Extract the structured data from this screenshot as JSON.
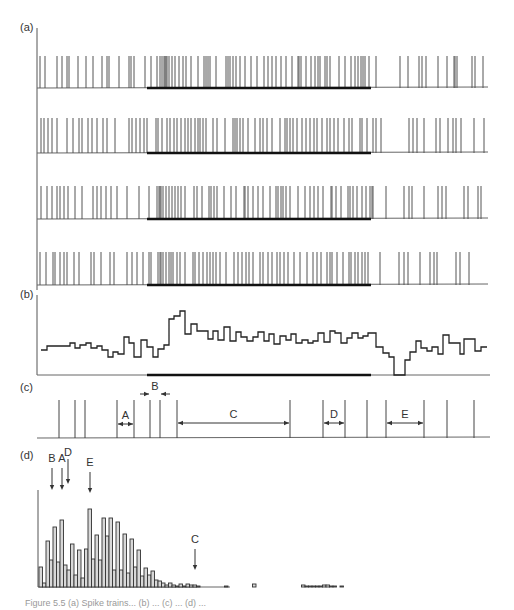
{
  "figure": {
    "panel_labels": {
      "a": "(a)",
      "b": "(b)",
      "c": "(c)",
      "d": "(d)"
    },
    "caption_partial": "Figure 5.5 (a) Spike trains... (b) ... (c) ... (d) ..."
  },
  "chart_data": [
    {
      "panel": "a",
      "type": "raster",
      "title": "",
      "description": "Four spike-train trials; thick bar marks stimulus period",
      "axis_x": 37,
      "stimulus_bar": {
        "x_start": 147,
        "x_end": 371
      },
      "rows": [
        {
          "baseline_y": 88,
          "top_y": 56,
          "spikes": [
            40,
            45,
            57,
            62,
            67,
            69,
            78,
            86,
            93,
            102,
            107,
            109,
            119,
            129,
            131,
            134,
            145,
            151,
            157,
            160,
            162,
            164,
            165,
            166,
            167,
            169,
            172,
            175,
            179,
            183,
            186,
            191,
            198,
            204,
            206,
            208,
            210,
            216,
            226,
            228,
            230,
            233,
            236,
            240,
            245,
            251,
            257,
            264,
            268,
            272,
            276,
            281,
            286,
            292,
            298,
            299,
            301,
            306,
            311,
            315,
            318,
            320,
            325,
            327,
            330,
            339,
            345,
            351,
            355,
            358,
            361,
            363,
            365,
            369,
            376,
            400,
            408,
            419,
            422,
            426,
            438,
            447,
            454,
            455,
            457,
            472,
            475,
            483
          ]
        },
        {
          "baseline_y": 153,
          "top_y": 118,
          "spikes": [
            41,
            44,
            48,
            52,
            57,
            67,
            73,
            79,
            82,
            88,
            92,
            97,
            103,
            107,
            115,
            129,
            132,
            136,
            140,
            144,
            147,
            156,
            158,
            162,
            167,
            170,
            174,
            177,
            181,
            185,
            188,
            191,
            195,
            198,
            200,
            203,
            206,
            213,
            217,
            225,
            233,
            235,
            237,
            240,
            243,
            248,
            255,
            260,
            263,
            267,
            272,
            280,
            285,
            287,
            290,
            293,
            297,
            302,
            306,
            310,
            314,
            317,
            322,
            327,
            330,
            334,
            338,
            344,
            349,
            352,
            360,
            362,
            367,
            373,
            376,
            381,
            409,
            413,
            417,
            424,
            436,
            440,
            448,
            453,
            456,
            461,
            474,
            484
          ]
        },
        {
          "baseline_y": 219,
          "top_y": 186,
          "spikes": [
            41,
            47,
            52,
            57,
            60,
            64,
            68,
            75,
            82,
            93,
            97,
            101,
            106,
            111,
            117,
            127,
            139,
            149,
            157,
            159,
            160,
            161,
            163,
            166,
            169,
            172,
            175,
            178,
            181,
            185,
            194,
            197,
            202,
            209,
            211,
            214,
            217,
            224,
            231,
            236,
            244,
            245,
            248,
            253,
            258,
            263,
            270,
            276,
            278,
            281,
            283,
            286,
            290,
            298,
            305,
            310,
            314,
            318,
            323,
            331,
            332,
            336,
            341,
            348,
            350,
            353,
            357,
            362,
            366,
            370,
            372,
            373,
            386,
            404,
            409,
            412,
            424,
            438,
            442,
            446,
            464,
            468,
            478,
            481
          ]
        },
        {
          "baseline_y": 285,
          "top_y": 252,
          "spikes": [
            40,
            46,
            53,
            55,
            60,
            64,
            67,
            74,
            79,
            91,
            94,
            101,
            110,
            114,
            127,
            132,
            137,
            143,
            149,
            151,
            158,
            160,
            161,
            163,
            166,
            169,
            171,
            173,
            177,
            180,
            185,
            193,
            195,
            199,
            203,
            207,
            210,
            213,
            216,
            220,
            226,
            234,
            238,
            242,
            246,
            249,
            253,
            260,
            263,
            268,
            272,
            277,
            280,
            284,
            288,
            294,
            300,
            307,
            313,
            317,
            321,
            327,
            330,
            332,
            337,
            343,
            349,
            351,
            355,
            358,
            362,
            365,
            368,
            380,
            399,
            404,
            408,
            420,
            430,
            434,
            437,
            456,
            460,
            469
          ]
        }
      ]
    },
    {
      "panel": "b",
      "type": "step",
      "title": "",
      "description": "Peri-stimulus time histogram (firing rate), step plot",
      "axis": {
        "x0": 37,
        "x1": 490,
        "y_baseline": 375,
        "y_top": 295
      },
      "stimulus_bar": {
        "x_start": 147,
        "x_end": 371
      },
      "x_edges": [
        41,
        47,
        64,
        70,
        75,
        80,
        86,
        91,
        97,
        102,
        108,
        113,
        118,
        124,
        129,
        134,
        141,
        147,
        153,
        158,
        164,
        169,
        174,
        180,
        185,
        191,
        197,
        202,
        208,
        213,
        218,
        224,
        230,
        236,
        241,
        247,
        253,
        258,
        264,
        269,
        274,
        280,
        286,
        291,
        296,
        302,
        308,
        313,
        318,
        324,
        330,
        335,
        341,
        347,
        352,
        358,
        363,
        368,
        376,
        383,
        389,
        394,
        400,
        405,
        410,
        416,
        421,
        427,
        432,
        438,
        443,
        449,
        454,
        460,
        464,
        469,
        475,
        481,
        487
      ],
      "y_levels": [
        350,
        346,
        346,
        343,
        348,
        345,
        343,
        348,
        346,
        350,
        357,
        352,
        354,
        337,
        343,
        357,
        340,
        347,
        357,
        349,
        345,
        319,
        316,
        311,
        334,
        324,
        331,
        331,
        339,
        331,
        340,
        327,
        341,
        332,
        337,
        341,
        337,
        332,
        341,
        334,
        344,
        336,
        340,
        334,
        343,
        340,
        343,
        341,
        333,
        342,
        331,
        333,
        343,
        338,
        333,
        338,
        336,
        333,
        347,
        353,
        357,
        375,
        375,
        360,
        352,
        341,
        348,
        351,
        347,
        354,
        335,
        343,
        343,
        354,
        339,
        339,
        351,
        347
      ]
    },
    {
      "panel": "c",
      "type": "raster",
      "title": "",
      "description": "Example spike train with labeled interspike intervals",
      "baseline_y": 438,
      "top_y": 400,
      "axis_x0": 37,
      "axis_x1": 490,
      "spikes": [
        59,
        75,
        85,
        117,
        134,
        150,
        160,
        177,
        290,
        323,
        345,
        367,
        386,
        424,
        447,
        474
      ],
      "intervals": [
        {
          "label": "A",
          "from": 117,
          "to": 134,
          "y": 424,
          "style": "inside"
        },
        {
          "label": "B",
          "from": 150,
          "to": 160,
          "y": 394,
          "style": "outside"
        },
        {
          "label": "C",
          "from": 177,
          "to": 290,
          "y": 423,
          "style": "inside"
        },
        {
          "label": "D",
          "from": 323,
          "to": 345,
          "y": 423,
          "style": "inside"
        },
        {
          "label": "E",
          "from": 386,
          "to": 424,
          "y": 423,
          "style": "inside"
        }
      ]
    },
    {
      "panel": "d",
      "type": "bar",
      "title": "",
      "description": "Interspike interval histogram; arrows mark intervals A–E from panel (c)",
      "axis": {
        "x0": 38,
        "x1": 230,
        "y_baseline": 587,
        "y_top": 490
      },
      "bin_width": 3.5,
      "x_start": 39,
      "values": [
        20,
        4,
        46,
        27,
        60,
        25,
        67,
        22,
        17,
        43,
        12,
        37,
        9,
        38,
        78,
        28,
        52,
        27,
        69,
        51,
        69,
        17,
        65,
        17,
        53,
        14,
        48,
        20,
        37,
        11,
        19,
        12,
        16,
        7,
        6,
        4,
        2,
        4,
        2,
        1,
        3,
        1,
        3,
        2,
        2,
        1,
        0,
        0,
        0,
        0,
        0,
        0,
        0,
        1,
        0,
        0,
        0,
        0,
        0,
        0,
        0,
        3,
        0,
        0,
        0,
        0,
        0,
        0,
        0,
        0,
        0,
        0,
        0,
        0,
        0,
        2,
        1,
        1,
        1,
        1,
        1,
        2,
        2,
        1,
        1,
        0,
        1
      ],
      "arrows": [
        {
          "label": "B",
          "x": 52,
          "label_y": 462,
          "y_start": 468,
          "y_end": 490
        },
        {
          "label": "A",
          "x": 62,
          "label_y": 462,
          "y_start": 468,
          "y_end": 490
        },
        {
          "label": "D",
          "x": 68,
          "label_y": 456,
          "y_start": 459,
          "y_end": 484
        },
        {
          "label": "E",
          "x": 90,
          "label_y": 466,
          "y_start": 472,
          "y_end": 493
        },
        {
          "label": "C",
          "x": 195,
          "label_y": 543,
          "y_start": 549,
          "y_end": 570
        }
      ],
      "xlabel": "",
      "ylabel": ""
    }
  ]
}
